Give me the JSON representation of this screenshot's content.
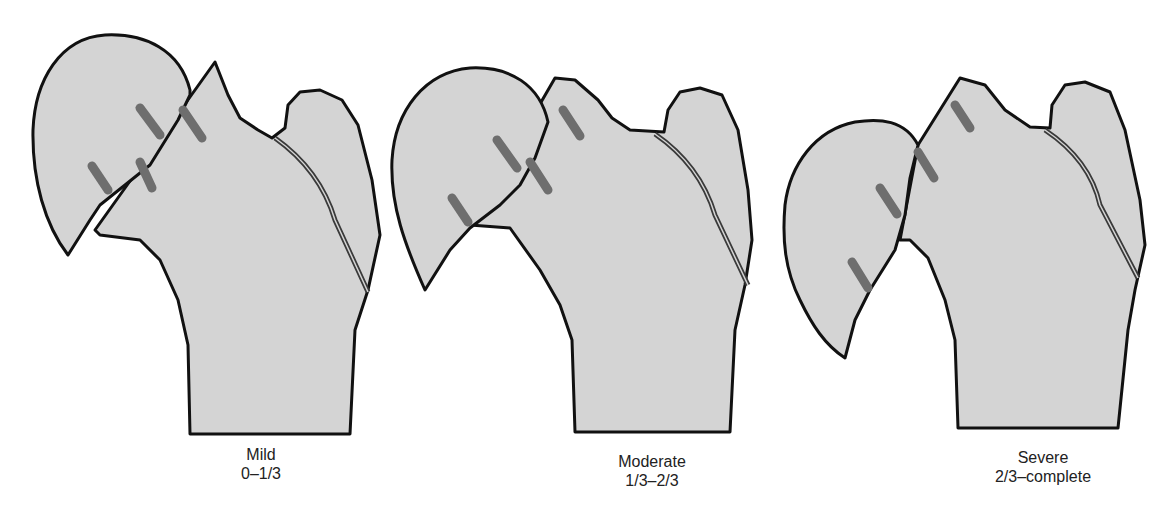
{
  "figure": {
    "colors": {
      "bone_fill": "#d4d4d4",
      "outline": "#111111",
      "marker": "#6e6e6e",
      "physis_line": "#3a3a3a",
      "background": "#ffffff"
    },
    "panels": [
      {
        "id": "mild",
        "title": "Mild",
        "range": "0–1/3"
      },
      {
        "id": "moderate",
        "title": "Moderate",
        "range": "1/3–2/3"
      },
      {
        "id": "severe",
        "title": "Severe",
        "range": "2/3–complete"
      }
    ]
  }
}
